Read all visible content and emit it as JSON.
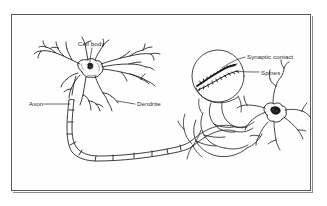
{
  "figure": {
    "style": "black ink line drawing on white, scanned textbook figure",
    "frame": {
      "present": true,
      "color": "#5a5a5e"
    },
    "background_color": "#ffffff",
    "ink_color": "#1a1a1a"
  },
  "labels": [
    {
      "id": "cell-body",
      "text": "Cell body",
      "leader": true
    },
    {
      "id": "axon",
      "text": "Axon",
      "leader": true
    },
    {
      "id": "dendrite",
      "text": "Dendrite",
      "leader": true
    },
    {
      "id": "synaptic-contact",
      "text": "Synaptic contact",
      "leader": true
    },
    {
      "id": "spines",
      "text": "Spines",
      "leader": true
    }
  ],
  "structures": [
    {
      "id": "presynaptic-neuron",
      "name": "presynaptic neuron",
      "side": "left"
    },
    {
      "id": "myelinated-axon",
      "name": "myelinated axon",
      "segments": 9
    },
    {
      "id": "magnifier-circle",
      "name": "magnification circle of spiny dendrite"
    },
    {
      "id": "postsynaptic-neuron",
      "name": "postsynaptic neuron",
      "side": "right"
    }
  ]
}
